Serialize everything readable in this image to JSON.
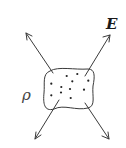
{
  "diagram": {
    "field_label": "E",
    "charge_density_label": "ρ",
    "colors": {
      "stroke": "#3a3a3a",
      "dot": "#222222",
      "background": "#ffffff"
    },
    "region": {
      "shape": "irregular-rounded-blob",
      "charge_dots": 11
    },
    "arrows": [
      {
        "name": "field-arrow-up-left",
        "direction": "outward"
      },
      {
        "name": "field-arrow-up-right",
        "direction": "outward"
      },
      {
        "name": "field-arrow-down-left",
        "direction": "outward"
      },
      {
        "name": "field-arrow-down-right",
        "direction": "outward"
      }
    ]
  }
}
